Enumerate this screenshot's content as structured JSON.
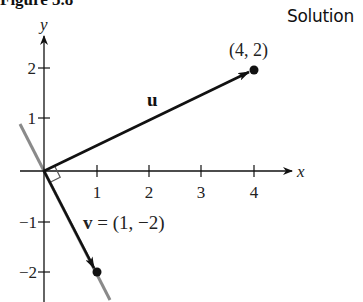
{
  "figure": {
    "title": "Figure 5.8",
    "corner_label": "Solution"
  },
  "axes": {
    "x_label": "x",
    "y_label": "y",
    "x_ticks": [
      "1",
      "2",
      "3",
      "4"
    ],
    "y_ticks_positive": [
      "1",
      "2"
    ],
    "y_ticks_negative": [
      "−1",
      "−2"
    ]
  },
  "vectors": {
    "u": {
      "label": "u",
      "endpoint_label": "(4, 2)",
      "x": 4,
      "y": 2
    },
    "v": {
      "label_bold": "v",
      "label_rest": " = (1, −2)",
      "x": 1,
      "y": -2
    }
  },
  "annotations": {
    "right_angle": "u ⊥ v at origin",
    "line_through_v": "gray line through origin along v"
  },
  "colors": {
    "ink": "#111111",
    "gray_line": "#8a8a8a"
  }
}
